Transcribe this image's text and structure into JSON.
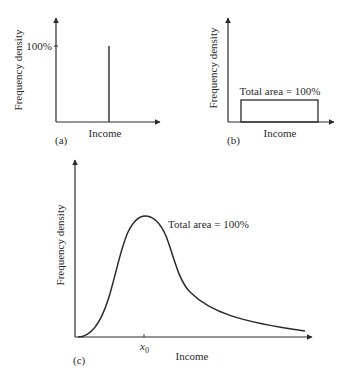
{
  "panels": [
    {
      "id": "a",
      "label": "(a)",
      "xlabel": "Income",
      "ylabel": "Frequency density",
      "tick_label": "100%",
      "description": "Single spike at one income level reaching 100%"
    },
    {
      "id": "b",
      "label": "(b)",
      "xlabel": "Income",
      "ylabel": "Frequency density",
      "annotation": "Total area = 100%",
      "description": "Uniform rectangular distribution"
    },
    {
      "id": "c",
      "label": "(c)",
      "xlabel": "Income",
      "ylabel": "Frequency density",
      "annotation": "Total area = 100%",
      "tick_label": "x",
      "tick_sub": "0",
      "description": "Right-skewed income distribution with mode at x0"
    }
  ],
  "colors": {
    "ink": "#2a2a2a",
    "background": "#ffffff"
  }
}
